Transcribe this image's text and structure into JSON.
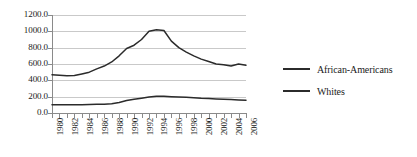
{
  "chart_data": {
    "type": "line",
    "title": "",
    "subtitle": "",
    "xlabel": "",
    "ylabel": "",
    "grid": true,
    "legend_position": "right",
    "ylim": [
      0,
      1200
    ],
    "ytick_labels": [
      "1200.0",
      "1000.0",
      "800.0",
      "600.0",
      "400.0",
      "200.0",
      "0.0"
    ],
    "ytick_values": [
      1200,
      1000,
      800,
      600,
      400,
      200,
      0
    ],
    "xlim": [
      1980,
      2006
    ],
    "x": [
      1980,
      1981,
      1982,
      1983,
      1984,
      1985,
      1986,
      1987,
      1988,
      1989,
      1990,
      1991,
      1992,
      1993,
      1994,
      1995,
      1996,
      1997,
      1998,
      1999,
      2000,
      2001,
      2002,
      2003,
      2004,
      2005,
      2006
    ],
    "xtick_labels": [
      "1980",
      "1982",
      "1984",
      "1986",
      "1988",
      "1990",
      "1992",
      "1994",
      "1996",
      "1998",
      "2000",
      "2002",
      "2004",
      "2006"
    ],
    "xtick_values": [
      1980,
      1982,
      1984,
      1986,
      1988,
      1990,
      1992,
      1994,
      1996,
      1998,
      2000,
      2002,
      2004,
      2006
    ],
    "series": [
      {
        "name": "African-Americans",
        "color": "#2b2b2b",
        "values": [
          468,
          462,
          455,
          458,
          478,
          500,
          540,
          575,
          625,
          700,
          790,
          830,
          900,
          1000,
          1020,
          1010,
          880,
          800,
          745,
          700,
          660,
          630,
          600,
          590,
          575,
          600,
          585
        ]
      },
      {
        "name": "Whites",
        "color": "#2b2b2b",
        "values": [
          100,
          100,
          100,
          100,
          102,
          104,
          106,
          108,
          112,
          128,
          152,
          168,
          182,
          196,
          204,
          205,
          200,
          196,
          192,
          188,
          182,
          178,
          172,
          168,
          164,
          160,
          157
        ]
      }
    ]
  },
  "legend": {
    "entries": [
      {
        "label": "African-Americans",
        "swatch": "line-swatch"
      },
      {
        "label": "Whites",
        "swatch": "line-swatch"
      }
    ]
  }
}
